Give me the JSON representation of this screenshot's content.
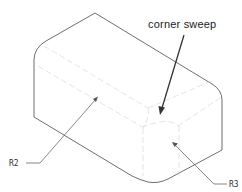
{
  "diagram": {
    "type": "isometric-part-drawing",
    "labels": {
      "callout": "corner sweep",
      "radius_left": "R2",
      "radius_right": "R3"
    },
    "colors": {
      "outline": "#4a4a4a",
      "hidden_edges": "#d2d2d2",
      "text": "#1a1a1a",
      "background": "#ffffff"
    }
  }
}
